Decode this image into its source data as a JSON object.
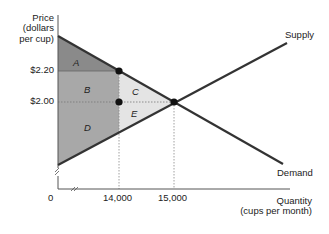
{
  "diagram": {
    "y_axis_label": [
      "Price",
      "(dollars",
      "per cup)"
    ],
    "x_axis_label": [
      "Quantity",
      "(cups per month)"
    ],
    "origin_label": "0",
    "price_ticks": [
      "$2.20",
      "$2.00"
    ],
    "quantity_ticks": [
      "14,000",
      "15,000"
    ],
    "curves": {
      "supply": "Supply",
      "demand": "Demand"
    },
    "regions": {
      "a": "A",
      "b": "B",
      "c": "C",
      "d": "D",
      "e": "E"
    },
    "colors": {
      "region_a": "#8a8a8a",
      "region_bd": "#a8a8a8",
      "region_ce": "#e4e4e4",
      "curve": "#333333"
    }
  }
}
